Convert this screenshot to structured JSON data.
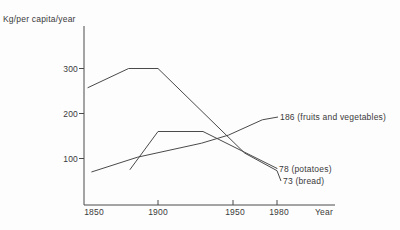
{
  "colors": {
    "line": "#4a4a4a",
    "text": "#3a3a3a",
    "background": "#fdfdfd"
  },
  "chart_data": {
    "type": "line",
    "title": "",
    "ylabel": "Kg/per capita/year",
    "xlabel": "Year",
    "xlim": [
      1845,
      1985
    ],
    "ylim": [
      0,
      380
    ],
    "grid": false,
    "legend_position": "line-end-labels",
    "y_ticks": [
      {
        "label": "100",
        "value": 100
      },
      {
        "label": "200",
        "value": 200
      },
      {
        "label": "300",
        "value": 300
      }
    ],
    "x_ticks": [
      {
        "label": "1850",
        "year": 1850,
        "has_tick": false
      },
      {
        "label": "1900",
        "year": 1900,
        "has_tick": true
      },
      {
        "label": "1950",
        "year": 1950,
        "has_tick": true
      },
      {
        "label": "1980",
        "year": 1980,
        "has_tick": true
      }
    ],
    "series": [
      {
        "key": "bread",
        "name": "bread",
        "end_label": "73 (bread)",
        "end_value": 73,
        "points": [
          {
            "year": 1845,
            "value": 257
          },
          {
            "year": 1877,
            "value": 300
          },
          {
            "year": 1900,
            "value": 300
          },
          {
            "year": 1958,
            "value": 112
          },
          {
            "year": 1980,
            "value": 73
          }
        ]
      },
      {
        "key": "potatoes",
        "name": "potatoes",
        "end_label": "78 (potatoes)",
        "end_value": 78,
        "points": [
          {
            "year": 1878,
            "value": 75
          },
          {
            "year": 1900,
            "value": 160
          },
          {
            "year": 1930,
            "value": 160
          },
          {
            "year": 1980,
            "value": 78
          }
        ]
      },
      {
        "key": "fruits",
        "name": "fruits and vegetables",
        "end_label": "186 (fruits and vegetables)",
        "end_value": 186,
        "points": [
          {
            "year": 1848,
            "value": 70
          },
          {
            "year": 1884,
            "value": 103
          },
          {
            "year": 1929,
            "value": 134
          },
          {
            "year": 1947,
            "value": 152
          },
          {
            "year": 1970,
            "value": 186
          }
        ]
      }
    ]
  }
}
